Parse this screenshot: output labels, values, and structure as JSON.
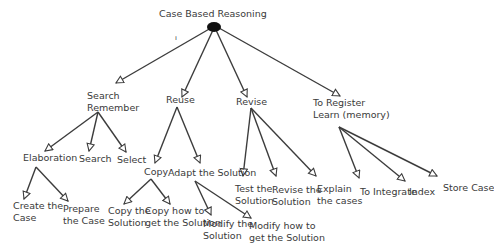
{
  "diagram": {
    "type": "tree",
    "root": {
      "label": "Case Based Reasoning",
      "annotation": "ı"
    },
    "nodes": {
      "search_remember": {
        "lines": [
          "Search",
          "Remember"
        ]
      },
      "reuse": {
        "lines": [
          "Reuse"
        ]
      },
      "revise": {
        "lines": [
          "Revise"
        ]
      },
      "to_register": {
        "lines": [
          "To Register",
          "Learn (memory)"
        ]
      },
      "elaboration": {
        "lines": [
          "Elaboration"
        ]
      },
      "search": {
        "lines": [
          "Search"
        ]
      },
      "select": {
        "lines": [
          "Select"
        ]
      },
      "create_case": {
        "lines": [
          "Create the",
          "Case"
        ]
      },
      "prepare_case": {
        "lines": [
          "Prepare",
          "the Case"
        ]
      },
      "copy": {
        "lines": [
          "Copy"
        ]
      },
      "adapt_solution": {
        "lines": [
          "Adapt the Solution"
        ]
      },
      "copy_solution": {
        "lines": [
          "Copy the",
          "Solution"
        ]
      },
      "copy_how": {
        "lines": [
          "Copy how to",
          "get the Solution"
        ]
      },
      "modify_solution": {
        "lines": [
          "Modify the",
          "Solution"
        ]
      },
      "modify_how": {
        "lines": [
          "Modify how to",
          "get the Solution"
        ]
      },
      "test_solution": {
        "lines": [
          "Test the",
          "Solution"
        ]
      },
      "revise_solution": {
        "lines": [
          "Revise the",
          "Solution"
        ]
      },
      "explain_cases": {
        "lines": [
          "Explain",
          "the cases"
        ]
      },
      "to_integrate": {
        "lines": [
          "To Integrate"
        ]
      },
      "index": {
        "lines": [
          "Index"
        ]
      },
      "store_case": {
        "lines": [
          "Store Case"
        ]
      }
    },
    "edges": [
      [
        "root",
        "search_remember"
      ],
      [
        "root",
        "reuse"
      ],
      [
        "root",
        "revise"
      ],
      [
        "root",
        "to_register"
      ],
      [
        "search_remember",
        "elaboration"
      ],
      [
        "search_remember",
        "search"
      ],
      [
        "search_remember",
        "select"
      ],
      [
        "elaboration",
        "create_case"
      ],
      [
        "elaboration",
        "prepare_case"
      ],
      [
        "reuse",
        "copy"
      ],
      [
        "reuse",
        "adapt_solution"
      ],
      [
        "copy",
        "copy_solution"
      ],
      [
        "copy",
        "copy_how"
      ],
      [
        "adapt_solution",
        "modify_solution"
      ],
      [
        "adapt_solution",
        "modify_how"
      ],
      [
        "revise",
        "test_solution"
      ],
      [
        "revise",
        "revise_solution"
      ],
      [
        "revise",
        "explain_cases"
      ],
      [
        "to_register",
        "to_integrate"
      ],
      [
        "to_register",
        "index"
      ],
      [
        "to_register",
        "store_case"
      ]
    ],
    "colors": {
      "line": "#3c3c3c",
      "text": "#3a3a3a",
      "root_node": "#111111",
      "background": "#ffffff"
    }
  }
}
